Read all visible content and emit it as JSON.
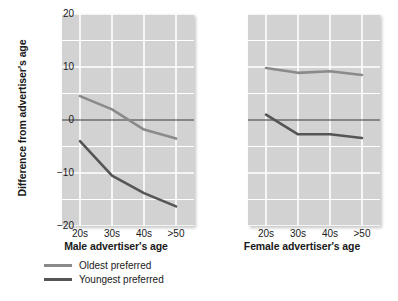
{
  "axis": {
    "y_title": "Difference from advertiser's age",
    "y_ticks": [
      "20",
      "10",
      "0",
      "-10",
      "-20"
    ],
    "x_ticks": [
      "20s",
      "30s",
      "40s",
      ">50"
    ]
  },
  "panels": {
    "male_title": "Male advertiser's age",
    "female_title": "Female advertiser's age"
  },
  "legend": {
    "items": [
      {
        "label": "Oldest preferred",
        "color": "#8a8a8a"
      },
      {
        "label": "Youngest preferred",
        "color": "#555555"
      }
    ]
  },
  "colors": {
    "plot_background": "#d2d2d2",
    "gridline": "#ffffff",
    "oldest": "#8a8a8a",
    "youngest": "#555555"
  },
  "chart_data": [
    {
      "type": "line",
      "title": "Male advertiser's age",
      "xlabel": "Male advertiser's age",
      "ylabel": "Difference from advertiser's age",
      "categories": [
        "20s",
        "30s",
        "40s",
        ">50"
      ],
      "ylim": [
        -20,
        20
      ],
      "yticks": [
        20,
        10,
        0,
        -10,
        -20
      ],
      "grid": true,
      "legend_position": "bottom-left-outside",
      "series": [
        {
          "name": "Oldest preferred",
          "values": [
            4.5,
            2.0,
            -1.8,
            -3.5
          ]
        },
        {
          "name": "Youngest preferred",
          "values": [
            -4.0,
            -10.5,
            -13.8,
            -16.3
          ]
        }
      ]
    },
    {
      "type": "line",
      "title": "Female advertiser's age",
      "xlabel": "Female advertiser's age",
      "ylabel": "Difference from advertiser's age",
      "categories": [
        "20s",
        "30s",
        "40s",
        ">50"
      ],
      "ylim": [
        -20,
        20
      ],
      "yticks": [
        20,
        10,
        0,
        -10,
        -20
      ],
      "grid": true,
      "legend_position": "bottom-left-outside",
      "series": [
        {
          "name": "Oldest preferred",
          "values": [
            9.8,
            8.9,
            9.2,
            8.5
          ]
        },
        {
          "name": "Youngest preferred",
          "values": [
            1.0,
            -2.7,
            -2.7,
            -3.4
          ]
        }
      ]
    }
  ]
}
